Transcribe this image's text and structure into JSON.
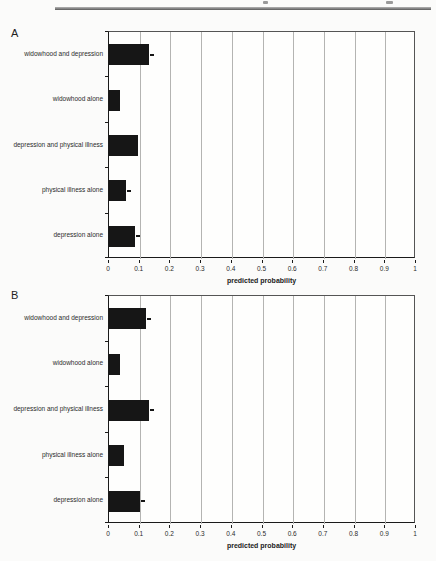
{
  "page": {
    "header_rule_color": "#5a5a5a",
    "background": "#fbfbfa"
  },
  "figure": {
    "panels": [
      {
        "label": "A"
      },
      {
        "label": "B"
      }
    ]
  },
  "chart_data": [
    {
      "type": "bar",
      "orientation": "horizontal",
      "panel_label": "A",
      "title": "",
      "xlabel": "predicted probability",
      "ylabel": "",
      "xlim": [
        0,
        1
      ],
      "x_tick_labels": [
        "0",
        "0.1",
        "0.2",
        "0.3",
        "0.4",
        "0.5",
        "0.6",
        "0.7",
        "0.8",
        "0.9",
        "1"
      ],
      "grid": true,
      "legend": false,
      "bar_color": "#161616",
      "categories": [
        "widowhood and depression",
        "widowhood alone",
        "depression and physical illness",
        "physical illness alone",
        "depression alone"
      ],
      "values": [
        0.13,
        0.035,
        0.095,
        0.055,
        0.085
      ],
      "tip_markers": [
        true,
        false,
        false,
        true,
        true
      ]
    },
    {
      "type": "bar",
      "orientation": "horizontal",
      "panel_label": "B",
      "title": "",
      "xlabel": "predicted probability",
      "ylabel": "",
      "xlim": [
        0,
        1
      ],
      "x_tick_labels": [
        "0",
        "0.1",
        "0.2",
        "0.3",
        "0.4",
        "0.5",
        "0.6",
        "0.7",
        "0.8",
        "0.9",
        "1"
      ],
      "grid": true,
      "legend": false,
      "bar_color": "#161616",
      "categories": [
        "widowhood and depression",
        "widowhood alone",
        "depression and physical illness",
        "physical illness alone",
        "depression alone"
      ],
      "values": [
        0.12,
        0.035,
        0.13,
        0.05,
        0.1
      ],
      "tip_markers": [
        true,
        false,
        true,
        false,
        true
      ]
    }
  ]
}
